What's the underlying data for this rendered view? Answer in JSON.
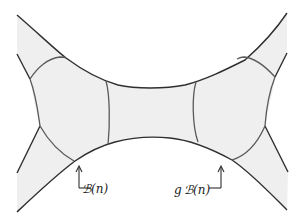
{
  "figure": {
    "type": "hyperbolic-fundamental-domains-diagram",
    "colors": {
      "stroke": "#3a3a3a",
      "fill": "#efefef",
      "background": "#ffffff"
    }
  },
  "labels": {
    "left_region": "ℬ(n)",
    "right_region": "g ℬ(n)"
  },
  "regions": [
    {
      "name": "B(n)",
      "side": "left"
    },
    {
      "name": "gB(n)",
      "side": "right"
    }
  ]
}
